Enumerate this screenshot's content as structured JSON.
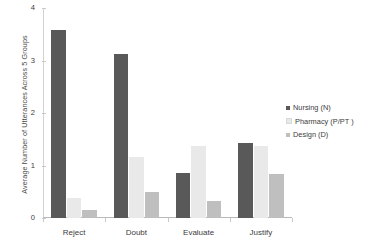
{
  "chart_data": {
    "type": "bar",
    "title": "",
    "xlabel": "",
    "ylabel": "Average Number of Utterances Across 5 Groups",
    "categories": [
      "Reject",
      "Doubt",
      "Evaluate",
      "Justify"
    ],
    "ylim": [
      0,
      4
    ],
    "yticks": [
      "0",
      "1",
      "2",
      "3",
      "4"
    ],
    "grid": false,
    "legend_position": "right",
    "series": [
      {
        "name": "Nursing (N)",
        "color": "#595959",
        "values": [
          3.58,
          3.12,
          0.85,
          1.42
        ]
      },
      {
        "name": "Pharmacy (P/PT )",
        "color": "#e9e9e9",
        "values": [
          0.38,
          1.17,
          1.38,
          1.37
        ]
      },
      {
        "name": "Design (D)",
        "color": "#bfbfbf",
        "values": [
          0.15,
          0.49,
          0.32,
          0.83
        ]
      }
    ]
  }
}
